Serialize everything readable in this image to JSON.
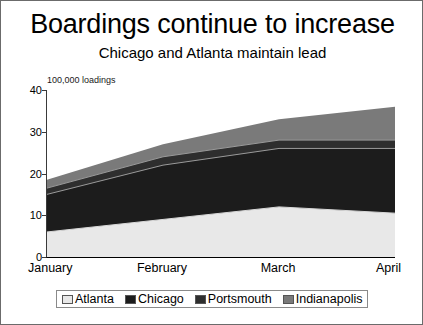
{
  "slide": {
    "title": "Boardings continue to increase",
    "subtitle": "Chicago and Atlanta maintain lead"
  },
  "chart_data": {
    "type": "area",
    "stacked": true,
    "title": "Boardings continue to increase",
    "subtitle": "Chicago and Atlanta maintain lead",
    "xlabel": "",
    "ylabel": "",
    "axis_note": "100,000 loadings",
    "categories": [
      "January",
      "February",
      "March",
      "April"
    ],
    "ytick_labels": [
      "0",
      "10",
      "20",
      "30",
      "40"
    ],
    "ytick_values": [
      0,
      10,
      20,
      30,
      40
    ],
    "ylim": [
      0,
      40
    ],
    "grid": false,
    "legend_position": "bottom",
    "series": [
      {
        "name": "Atlanta",
        "color": "#e8e8e8",
        "values": [
          6,
          9,
          12,
          10.5
        ]
      },
      {
        "name": "Chicago",
        "color": "#1c1c1c",
        "values": [
          9,
          13,
          14,
          15.5
        ]
      },
      {
        "name": "Portsmouth",
        "color": "#2e2e2e",
        "values": [
          1.5,
          2,
          2,
          2
        ]
      },
      {
        "name": "Indianapolis",
        "color": "#7a7a7a",
        "values": [
          2,
          3,
          5,
          8
        ]
      }
    ],
    "stack_tops": {
      "Atlanta": [
        6,
        9,
        12,
        10.5
      ],
      "Chicago": [
        15,
        22,
        26,
        26
      ],
      "Portsmouth": [
        16.5,
        24,
        28,
        28
      ],
      "Indianapolis": [
        18.5,
        27,
        33,
        36
      ]
    }
  },
  "legend": {
    "items": [
      {
        "label": "Atlanta",
        "color": "#e8e8e8"
      },
      {
        "label": "Chicago",
        "color": "#1c1c1c"
      },
      {
        "label": "Portsmouth",
        "color": "#2e2e2e"
      },
      {
        "label": "Indianapolis",
        "color": "#7a7a7a"
      }
    ]
  }
}
